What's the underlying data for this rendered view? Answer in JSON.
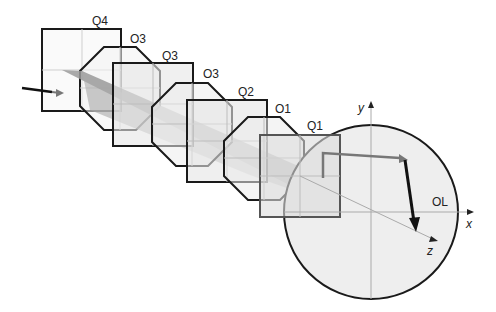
{
  "diagram": {
    "elements": [
      {
        "id": "Q4",
        "label": "Q4",
        "shape": "square"
      },
      {
        "id": "O3a",
        "label": "O3",
        "shape": "octagon"
      },
      {
        "id": "Q3",
        "label": "Q3",
        "shape": "square"
      },
      {
        "id": "O3b",
        "label": "O3",
        "shape": "octagon"
      },
      {
        "id": "Q2",
        "label": "Q2",
        "shape": "square"
      },
      {
        "id": "O1",
        "label": "O1",
        "shape": "octagon"
      },
      {
        "id": "Q1",
        "label": "Q1",
        "shape": "square"
      },
      {
        "id": "OL",
        "label": "OL",
        "shape": "circle"
      }
    ],
    "axes": {
      "x": "x",
      "y": "y",
      "z": "z"
    },
    "colors": {
      "outline": "#1a1a1a",
      "fill_light": "#e8e8e8",
      "beam": "#999999",
      "grid": "#bdbdbd",
      "arrow_gray": "#777777",
      "arrow_black": "#111111"
    }
  }
}
